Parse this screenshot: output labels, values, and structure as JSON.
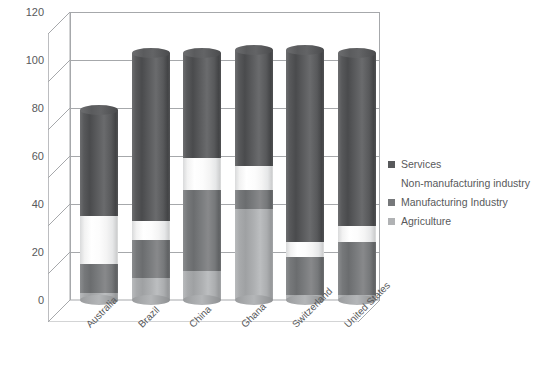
{
  "chart_data": {
    "type": "bar",
    "subtype": "stacked-cylinder-3d",
    "title": "",
    "xlabel": "",
    "ylabel": "",
    "ylim": [
      0,
      120
    ],
    "ytick_step": 20,
    "yticks": [
      0,
      20,
      40,
      60,
      80,
      100,
      120
    ],
    "grid": true,
    "legend_position": "right",
    "categories": [
      "Australia",
      "Brazil",
      "China",
      "Ghana",
      "Switzerland",
      "United States"
    ],
    "series": [
      {
        "name": "Agriculture",
        "color": "#a8aaac",
        "values": [
          3,
          9,
          12,
          38,
          2,
          2
        ]
      },
      {
        "name": "Manufacturing Industry",
        "color": "#76787a",
        "values": [
          12,
          16,
          34,
          8,
          16,
          22
        ]
      },
      {
        "name": "Non-manufacturing industry",
        "color": "#ffffff",
        "values": [
          20,
          8,
          13,
          10,
          6,
          7
        ]
      },
      {
        "name": "Services",
        "color": "#58595b",
        "values": [
          44,
          70,
          44,
          48,
          80,
          72
        ]
      }
    ],
    "totals": [
      79,
      103,
      103,
      104,
      104,
      103
    ]
  },
  "axis": {
    "y_tick_labels": [
      "120",
      "100",
      "80",
      "60",
      "40",
      "20",
      "0"
    ]
  },
  "legend": {
    "items": [
      {
        "label": "Services",
        "swatch": "#58595b",
        "swatch_visible": true
      },
      {
        "label": "Non-manufacturing industry",
        "swatch": "#ffffff",
        "swatch_visible": false
      },
      {
        "label": "Manufacturing Industry",
        "swatch": "#76787a",
        "swatch_visible": true
      },
      {
        "label": "Agriculture",
        "swatch": "#b0b2b4",
        "swatch_visible": true
      }
    ]
  }
}
